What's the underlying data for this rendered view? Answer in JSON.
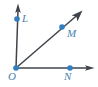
{
  "figure": {
    "background_color": "#ffffff",
    "ray_color": "#3f434a",
    "point_color": "#2f7fc1",
    "label_color": "#4a7fae",
    "width": 98,
    "height": 87
  },
  "vertex": {
    "name": "O",
    "label": "O",
    "x": 16,
    "y": 68
  },
  "points": [
    {
      "name": "L",
      "label": "L",
      "x": 17,
      "y": 19,
      "dot_radius": 2.6
    },
    {
      "name": "M",
      "label": "M",
      "x": 62,
      "y": 27,
      "dot_radius": 2.6
    },
    {
      "name": "N",
      "label": "N",
      "x": 70,
      "y": 68,
      "dot_radius": 2.6
    }
  ],
  "rays": [
    {
      "name": "ray-OL",
      "from": "O",
      "through": "L",
      "start_x": 16,
      "start_y": 68,
      "end_x": 18,
      "end_y": 6,
      "arrowhead": true
    },
    {
      "name": "ray-OM",
      "from": "O",
      "through": "M",
      "start_x": 16,
      "start_y": 68,
      "end_x": 82,
      "end_y": 11,
      "arrowhead": true
    },
    {
      "name": "ray-ON",
      "from": "O",
      "through": "N",
      "start_x": 16,
      "start_y": 68,
      "end_x": 94,
      "end_y": 68,
      "arrowhead": true
    }
  ]
}
